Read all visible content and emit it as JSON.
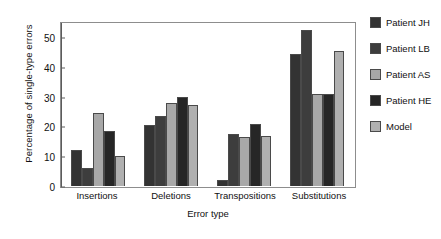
{
  "chart_data": {
    "type": "bar",
    "title": "",
    "xlabel": "Error type",
    "ylabel": "Percentage of single-type errors",
    "categories": [
      "Insertions",
      "Deletions",
      "Transpositions",
      "Substitutions"
    ],
    "series": [
      {
        "name": "Patient JH",
        "color": "#333333",
        "values": [
          12,
          20.5,
          2,
          44.5
        ]
      },
      {
        "name": "Patient LB",
        "color": "#3d3d3d",
        "values": [
          6,
          23.5,
          17.5,
          52.5
        ]
      },
      {
        "name": "Patient AS",
        "color": "#a8a8a8",
        "values": [
          24.5,
          28,
          16.5,
          31
        ]
      },
      {
        "name": "Patient HE",
        "color": "#262626",
        "values": [
          18.5,
          30,
          21,
          31
        ]
      },
      {
        "name": "Model",
        "color": "#b0b0b0",
        "values": [
          10,
          27.5,
          17,
          45.5
        ]
      }
    ],
    "ylim": [
      0,
      55
    ],
    "yticks": [
      0,
      10,
      20,
      30,
      40,
      50
    ],
    "grid": false,
    "legend_position": "right"
  }
}
